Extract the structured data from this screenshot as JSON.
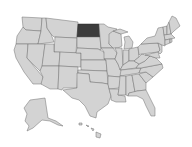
{
  "map": {
    "region": "United States",
    "highlighted_state": "North Dakota",
    "colors": {
      "background": "#ffffff",
      "state_fill": "#d3d3d3",
      "state_border": "#6e6e6e",
      "highlight_fill": "#3c3c3c"
    },
    "states": [
      {
        "id": "WA",
        "name": "Washington",
        "d": "M22,17 L42,18 L41,31 L26,30 L23,27 Z",
        "highlight": false
      },
      {
        "id": "OR",
        "name": "Oregon",
        "d": "M23,27 L26,30 L41,31 L38,44 L16,44 L17,36 Z",
        "highlight": false
      },
      {
        "id": "CA",
        "name": "California",
        "d": "M16,44 L28,44 L27,58 L43,77 L42,84 L33,84 L24,72 L16,58 L14,50 Z",
        "highlight": false
      },
      {
        "id": "ID",
        "name": "Idaho",
        "d": "M42,18 L46,18 L47,28 L51,34 L54,42 L38,44 L41,31 Z",
        "highlight": false
      },
      {
        "id": "NV",
        "name": "Nevada",
        "d": "M28,44 L45,44 L42,68 L40,71 L27,58 Z",
        "highlight": false
      },
      {
        "id": "MT",
        "name": "Montana",
        "d": "M46,18 L78,22 L77,38 L54,37 L51,34 L47,28 Z",
        "highlight": false
      },
      {
        "id": "WY",
        "name": "Wyoming",
        "d": "M55,37 L77,38 L76,53 L54,52 Z",
        "highlight": false
      },
      {
        "id": "UT",
        "name": "Utah",
        "d": "M45,44 L54,44 L54,52 L60,52 L59,66 L42,66 Z",
        "highlight": false
      },
      {
        "id": "AZ",
        "name": "Arizona",
        "d": "M42,66 L59,66 L58,89 L50,89 L41,84 L43,77 L40,71 Z",
        "highlight": false
      },
      {
        "id": "CO",
        "name": "Colorado",
        "d": "M60,52 L81,53 L81,67 L59,66 Z",
        "highlight": false
      },
      {
        "id": "NM",
        "name": "New Mexico",
        "d": "M59,66 L78,67 L77,88 L63,88 L62,90 L58,89 Z",
        "highlight": false
      },
      {
        "id": "ND",
        "name": "North Dakota",
        "d": "M78,24 L99,24 L100,37 L77,37 Z",
        "highlight": true
      },
      {
        "id": "SD",
        "name": "South Dakota",
        "d": "M77,37 L100,37 L101,50 L98,49 L77,48 Z",
        "highlight": false
      },
      {
        "id": "NE",
        "name": "Nebraska",
        "d": "M77,48 L98,49 L104,52 L106,60 L81,60 L81,53 L76,53 Z",
        "highlight": false
      },
      {
        "id": "KS",
        "name": "Kansas",
        "d": "M81,60 L106,60 L107,71 L81,70 Z",
        "highlight": false
      },
      {
        "id": "OK",
        "name": "Oklahoma",
        "d": "M78,70 L107,71 L108,84 L102,83 L90,82 L89,74 L78,73 Z",
        "highlight": false
      },
      {
        "id": "TX",
        "name": "Texas",
        "d": "M77,73 L89,74 L90,82 L102,83 L108,84 L111,96 L108,104 L97,112 L96,118 L90,116 L85,106 L79,100 L72,98 L63,90 L77,88 Z",
        "highlight": false
      },
      {
        "id": "MN",
        "name": "Minnesota",
        "d": "M99,24 L104,24 L108,27 L117,29 L110,35 L109,44 L113,48 L101,48 L100,37 Z",
        "highlight": false
      },
      {
        "id": "IA",
        "name": "Iowa",
        "d": "M101,48 L113,48 L117,53 L115,59 L104,59 L104,52 Z",
        "highlight": false
      },
      {
        "id": "MO",
        "name": "Missouri",
        "d": "M104,59 L115,59 L118,64 L122,72 L121,77 L108,76 L107,71 L106,60 Z",
        "highlight": false
      },
      {
        "id": "AR",
        "name": "Arkansas",
        "d": "M108,76 L121,77 L119,88 L109,89 L108,84 Z",
        "highlight": false
      },
      {
        "id": "LA",
        "name": "Louisiana",
        "d": "M109,89 L119,89 L118,95 L125,96 L126,102 L116,102 L111,100 L111,96 Z",
        "highlight": false
      },
      {
        "id": "WI",
        "name": "Wisconsin",
        "d": "M109,34 L113,31 L121,34 L122,46 L118,48 L113,48 L109,44 Z",
        "highlight": false
      },
      {
        "id": "IL",
        "name": "Illinois",
        "d": "M115,48 L122,48 L123,65 L120,70 L118,64 L115,59 L117,53 Z",
        "highlight": false
      },
      {
        "id": "MI",
        "name": "Michigan",
        "d": "M124,37 L129,36 L133,42 L132,48 L124,49 L125,42 Z M113,31 L120,29 L128,32 L121,34 Z",
        "highlight": false
      },
      {
        "id": "IN",
        "name": "Indiana",
        "d": "M123,50 L129,50 L129,61 L123,65 Z",
        "highlight": false
      },
      {
        "id": "OH",
        "name": "Ohio",
        "d": "M129,49 L138,47 L139,57 L134,61 L129,61 Z",
        "highlight": false
      },
      {
        "id": "KY",
        "name": "Kentucky",
        "d": "M120,70 L123,65 L129,61 L134,61 L139,64 L136,68 L121,70 Z",
        "highlight": false
      },
      {
        "id": "TN",
        "name": "Tennessee",
        "d": "M121,70 L141,68 L139,73 L120,76 Z",
        "highlight": false
      },
      {
        "id": "MS",
        "name": "Mississippi",
        "d": "M120,76 L126,76 L126,95 L118,95 L119,88 Z",
        "highlight": false
      },
      {
        "id": "AL",
        "name": "Alabama",
        "d": "M126,76 L132,75 L135,92 L129,93 L128,96 L126,95 Z",
        "highlight": false
      },
      {
        "id": "GA",
        "name": "Georgia",
        "d": "M132,75 L139,74 L146,83 L146,90 L137,91 L135,92 Z",
        "highlight": false
      },
      {
        "id": "FL",
        "name": "Florida",
        "d": "M128,96 L129,93 L137,91 L146,90 L150,98 L155,108 L155,116 L151,116 L146,106 L143,99 L137,96 Z",
        "highlight": false
      },
      {
        "id": "SC",
        "name": "South Carolina",
        "d": "M139,74 L146,72 L153,77 L146,83 Z",
        "highlight": false
      },
      {
        "id": "NC",
        "name": "North Carolina",
        "d": "M139,73 L141,68 L162,64 L163,68 L153,77 L146,72 Z",
        "highlight": false
      },
      {
        "id": "VA",
        "name": "Virginia",
        "d": "M136,68 L139,64 L145,61 L150,56 L156,58 L162,64 L141,68 Z",
        "highlight": false
      },
      {
        "id": "WV",
        "name": "West Virginia",
        "d": "M139,57 L142,54 L145,55 L150,56 L145,61 L139,64 L134,61 Z",
        "highlight": false
      },
      {
        "id": "PA",
        "name": "Pennsylvania",
        "d": "M138,47 L141,44 L158,43 L160,50 L158,52 L141,54 L139,55 Z",
        "highlight": false
      },
      {
        "id": "MD",
        "name": "Maryland",
        "d": "M145,55 L158,52 L160,58 L156,58 L150,56 Z",
        "highlight": false
      },
      {
        "id": "NJ",
        "name": "New Jersey",
        "d": "M158,43 L162,45 L162,52 L160,54 L158,52 L160,50 Z",
        "highlight": false
      },
      {
        "id": "NY",
        "name": "New York",
        "d": "M141,44 L147,38 L155,36 L158,28 L163,27 L165,40 L165,46 L162,45 L158,43 Z",
        "highlight": false
      },
      {
        "id": "VT",
        "name": "Vermont",
        "d": "M163,27 L167,26 L167,35 L164,35 Z",
        "highlight": false
      },
      {
        "id": "NH",
        "name": "New Hampshire",
        "d": "M167,26 L169,22 L171,34 L167,35 Z",
        "highlight": false
      },
      {
        "id": "MA",
        "name": "Massachusetts",
        "d": "M164,35 L171,34 L175,38 L165,40 Z",
        "highlight": false
      },
      {
        "id": "CT",
        "name": "Connecticut",
        "d": "M165,40 L170,39 L170,43 L165,45 Z",
        "highlight": false
      },
      {
        "id": "RI",
        "name": "Rhode Island",
        "d": "M170,39 L172,39 L172,42 L170,43 Z",
        "highlight": false
      },
      {
        "id": "ME",
        "name": "Maine",
        "d": "M169,22 L172,16 L176,18 L180,26 L174,31 L171,34 Z",
        "highlight": false
      },
      {
        "id": "AK",
        "name": "Alaska",
        "d": "M30,100 L45,98 L48,118 L56,121 L63,126 L58,125 L50,121 L42,120 L33,128 L27,131 L29,126 L25,121 L27,114 L24,108 Z",
        "highlight": false
      },
      {
        "id": "HI",
        "name": "Hawaii",
        "d": "M79,123 L82,123 L82,125 L79,125 Z M86,125 L89,126 L88,127 Z M91,128 L94,129 L93,131 Z M96,132 L101,134 L100,138 L96,137 Z",
        "highlight": false
      }
    ]
  }
}
